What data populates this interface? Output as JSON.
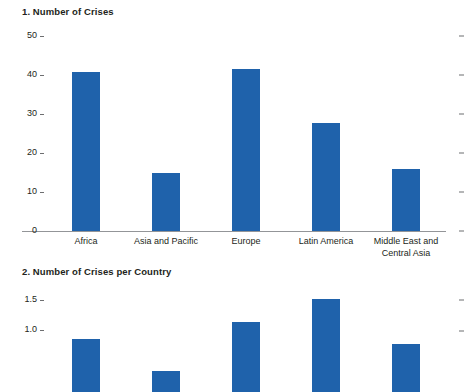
{
  "chart_data": [
    {
      "type": "bar",
      "title": "1. Number of Crises",
      "xlabel": "",
      "ylabel": "",
      "categories": [
        "Africa",
        "Asia and Pacific",
        "Europe",
        "Latin America",
        "Middle East and Central Asia"
      ],
      "values": [
        40.7,
        14.8,
        41.6,
        27.8,
        15.8
      ],
      "ylim": [
        0,
        50
      ],
      "yticks": [
        "0",
        "10",
        "20",
        "30",
        "40",
        "50"
      ],
      "ytick_values": [
        0,
        10,
        20,
        30,
        40,
        50
      ],
      "grid": false,
      "legend": null,
      "bar_color": "#1f62ab",
      "axis_color": "#939598"
    },
    {
      "type": "bar",
      "title": "2. Number of Crises per Country",
      "xlabel": "",
      "ylabel": "",
      "categories": [
        "Africa",
        "Asia and Pacific",
        "Europe",
        "Latin America",
        "Middle East and Central Asia"
      ],
      "values": [
        0.86,
        0.35,
        1.14,
        1.52,
        0.78
      ],
      "ylim": [
        0,
        1.6
      ],
      "yticks": [
        "1.0",
        "1.5"
      ],
      "ytick_values": [
        1.0,
        1.5
      ],
      "grid": false,
      "legend": null,
      "bar_color": "#1f62ab",
      "axis_color": "#939598",
      "note": "panel clipped at bottom edge of screenshot"
    }
  ]
}
